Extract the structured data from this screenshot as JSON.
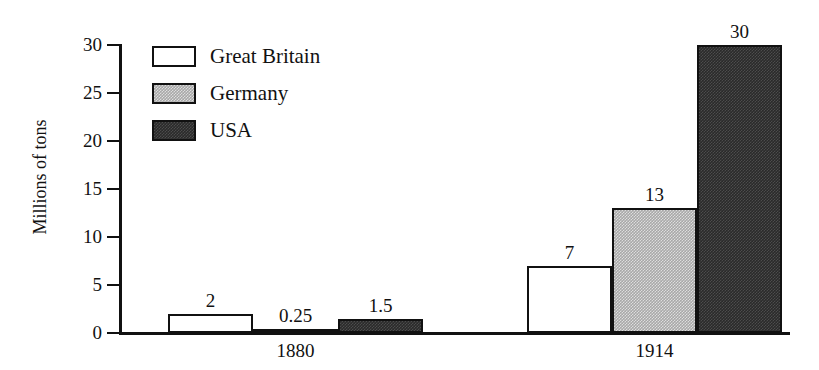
{
  "chart_data": {
    "type": "bar",
    "title": "",
    "xlabel": "",
    "ylabel": "Millions of tons",
    "ylim": [
      0,
      30
    ],
    "yticks": [
      "0",
      "5",
      "10",
      "15",
      "20",
      "25",
      "30"
    ],
    "grid": false,
    "legend_position": "top-left",
    "categories": [
      "1880",
      "1914"
    ],
    "series": [
      {
        "name": "Great Britain",
        "swatch": "white",
        "color": "#ffffff",
        "values": [
          2,
          7
        ],
        "value_labels": [
          "2",
          "7"
        ]
      },
      {
        "name": "Germany",
        "swatch": "gray",
        "color": "#a8a8a8",
        "values": [
          0.25,
          13
        ],
        "value_labels": [
          "0.25",
          "13"
        ]
      },
      {
        "name": "USA",
        "swatch": "dark",
        "color": "#2a2a2a",
        "values": [
          1.5,
          30
        ],
        "value_labels": [
          "1.5",
          "30"
        ]
      }
    ]
  },
  "axis": {
    "y_title": "Millions of tons",
    "ticks": [
      {
        "label": "30",
        "value": 30
      },
      {
        "label": "25",
        "value": 25
      },
      {
        "label": "20",
        "value": 20
      },
      {
        "label": "15",
        "value": 15
      },
      {
        "label": "10",
        "value": 10
      },
      {
        "label": "5",
        "value": 5
      },
      {
        "label": "0",
        "value": 0
      }
    ]
  },
  "legend": {
    "items": [
      {
        "label": "Great Britain",
        "swatch": "white"
      },
      {
        "label": "Germany",
        "swatch": "gray"
      },
      {
        "label": "USA",
        "swatch": "dark"
      }
    ]
  },
  "groups": [
    {
      "label": "1880",
      "bars": [
        {
          "series": "Great Britain",
          "value": 2,
          "label": "2",
          "swatch": "white"
        },
        {
          "series": "Germany",
          "value": 0.25,
          "label": "0.25",
          "swatch": "gray"
        },
        {
          "series": "USA",
          "value": 1.5,
          "label": "1.5",
          "swatch": "dark"
        }
      ]
    },
    {
      "label": "1914",
      "bars": [
        {
          "series": "Great Britain",
          "value": 7,
          "label": "7",
          "swatch": "white"
        },
        {
          "series": "Germany",
          "value": 13,
          "label": "13",
          "swatch": "gray"
        },
        {
          "series": "USA",
          "value": 30,
          "label": "30",
          "swatch": "dark"
        }
      ]
    }
  ],
  "colors": {
    "axis": "#111111",
    "background": "#ffffff",
    "great_britain": "#ffffff",
    "germany": "#a8a8a8",
    "usa": "#2a2a2a"
  }
}
